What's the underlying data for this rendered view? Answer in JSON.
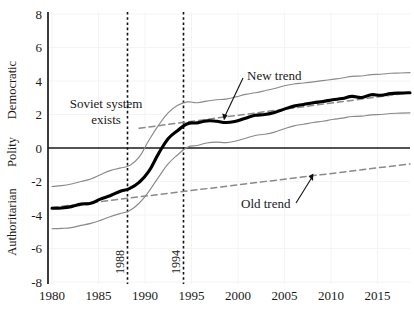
{
  "chart_data": {
    "type": "line",
    "title": "",
    "subtitle": "",
    "xlabel": "",
    "ylabel": "Polity",
    "xlim": [
      1980,
      2017
    ],
    "ylim": [
      -8,
      8
    ],
    "grid": true,
    "legend_position": "none",
    "x_ticks": [
      1980,
      1985,
      1990,
      1995,
      2000,
      2005,
      2010,
      2015
    ],
    "x_tick_labels": [
      "1980",
      "1985",
      "1990",
      "1995",
      "2000",
      "2005",
      "2010",
      "2015"
    ],
    "y_ticks": [
      8,
      6,
      4,
      2,
      0,
      -2,
      -4,
      -6,
      -8
    ],
    "y_tick_labels": [
      "8",
      "6",
      "4",
      "2",
      "0",
      "-2",
      "-4",
      "-6",
      "-8"
    ],
    "y_axis_labels": {
      "top": "Democratic",
      "middle": "Polity",
      "bottom": "Authoritarian"
    },
    "annotations": [
      {
        "text": "Soviet system\nexists",
        "line1": "Soviet system",
        "line2": "exists",
        "x": 1986.0,
        "y": 2.2
      },
      {
        "text": "New trend",
        "x": 2001.5,
        "y": 4.8
      },
      {
        "text": "Old trend",
        "x": 2003.0,
        "y": -3.2
      }
    ],
    "event_lines": [
      {
        "label": "1988",
        "x": 1988
      },
      {
        "label": "1994",
        "x": 1994
      }
    ],
    "zero_line": 0,
    "x": [
      1980,
      1981,
      1982,
      1983,
      1984,
      1985,
      1986,
      1987,
      1988,
      1989,
      1990,
      1991,
      1992,
      1993,
      1994,
      1995,
      1996,
      1997,
      1998,
      1999,
      2000,
      2001,
      2002,
      2003,
      2004,
      2005,
      2006,
      2007,
      2008,
      2009,
      2010,
      2011,
      2012,
      2013,
      2014,
      2015,
      2016,
      2017
    ],
    "series": [
      {
        "name": "Polity estimate",
        "style": "thick-black-line",
        "color": "#000000",
        "values": [
          -3.6,
          -3.58,
          -3.5,
          -3.35,
          -3.3,
          -3.05,
          -2.85,
          -2.6,
          -2.42,
          -2.05,
          -1.4,
          -0.35,
          0.55,
          1.05,
          1.45,
          1.5,
          1.62,
          1.6,
          1.52,
          1.6,
          1.78,
          1.95,
          2.0,
          2.12,
          2.32,
          2.5,
          2.6,
          2.7,
          2.78,
          2.88,
          2.95,
          3.08,
          3.02,
          3.18,
          3.15,
          3.25,
          3.28,
          3.3
        ]
      },
      {
        "name": "Upper confidence band",
        "style": "thin-gray-line",
        "color": "#8a8a8a",
        "values": [
          -2.3,
          -2.25,
          -2.15,
          -2.0,
          -1.85,
          -1.6,
          -1.35,
          -1.2,
          -1.05,
          -0.55,
          0.45,
          1.35,
          2.1,
          2.55,
          2.75,
          2.7,
          2.8,
          2.88,
          2.92,
          3.05,
          3.2,
          3.3,
          3.42,
          3.55,
          3.72,
          3.82,
          3.88,
          3.95,
          4.02,
          4.1,
          4.18,
          4.28,
          4.3,
          4.38,
          4.4,
          4.46,
          4.48,
          4.5
        ]
      },
      {
        "name": "Lower confidence band",
        "style": "thin-gray-line",
        "color": "#8a8a8a",
        "values": [
          -4.82,
          -4.8,
          -4.75,
          -4.62,
          -4.5,
          -4.32,
          -4.1,
          -3.92,
          -3.75,
          -3.3,
          -2.6,
          -1.75,
          -0.95,
          -0.4,
          0.05,
          0.15,
          0.3,
          0.35,
          0.32,
          0.42,
          0.58,
          0.75,
          0.82,
          0.95,
          1.15,
          1.32,
          1.42,
          1.52,
          1.6,
          1.7,
          1.78,
          1.88,
          1.9,
          1.98,
          2.0,
          2.06,
          2.08,
          2.1
        ]
      }
    ],
    "trend_lines": [
      {
        "name": "Old trend",
        "style": "dashed-gray",
        "color": "#8a8a8a",
        "x_start": 1980,
        "y_start": -3.55,
        "x_end": 2017,
        "y_end": -0.95
      },
      {
        "name": "New trend",
        "style": "dashed-gray",
        "color": "#8a8a8a",
        "x_start": 1989,
        "y_start": 1.18,
        "x_end": 2017,
        "y_end": 3.3
      }
    ]
  },
  "figure": {
    "background_color": "#ffffff",
    "axis_color": "#1a1a1a",
    "grid_color": "#f2f2f2",
    "band_color": "#8a8a8a",
    "main_color": "#000000"
  }
}
